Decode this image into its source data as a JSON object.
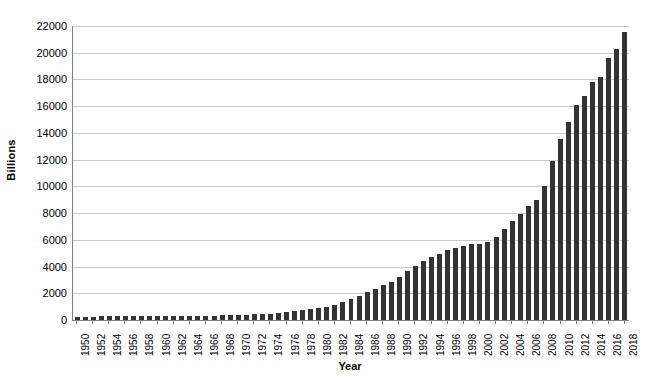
{
  "chart_data": {
    "type": "bar",
    "title": "",
    "subtitle": "",
    "xlabel": "Year",
    "ylabel": "Billions",
    "ylim": [
      0,
      22000
    ],
    "ytick_step": 2000,
    "yticks": [
      0,
      2000,
      4000,
      6000,
      8000,
      10000,
      12000,
      14000,
      16000,
      18000,
      20000,
      22000
    ],
    "ytick_labels": [
      "0",
      "2000",
      "4000",
      "6000",
      "8000",
      "10000",
      "12000",
      "14000",
      "16000",
      "18000",
      "20000",
      "22000"
    ],
    "xtick_label_step": 2,
    "xtick_labels": [
      "1950",
      "1952",
      "1954",
      "1956",
      "1958",
      "1960",
      "1962",
      "1964",
      "1966",
      "1968",
      "1970",
      "1972",
      "1974",
      "1976",
      "1978",
      "1980",
      "1982",
      "1984",
      "1986",
      "1988",
      "1990",
      "1992",
      "1994",
      "1996",
      "1998",
      "2000",
      "2002",
      "2004",
      "2006",
      "2008",
      "2010",
      "2012",
      "2014",
      "2016",
      "2018"
    ],
    "grid": true,
    "grid_axis": "y",
    "legend": false,
    "legend_position": "none",
    "bar_color": "#333333",
    "grid_color": "#c9c9c9",
    "axis_color": "#808080",
    "categories": [
      "1950",
      "1951",
      "1952",
      "1953",
      "1954",
      "1955",
      "1956",
      "1957",
      "1958",
      "1959",
      "1960",
      "1961",
      "1962",
      "1963",
      "1964",
      "1965",
      "1966",
      "1967",
      "1968",
      "1969",
      "1970",
      "1971",
      "1972",
      "1973",
      "1974",
      "1975",
      "1976",
      "1977",
      "1978",
      "1979",
      "1980",
      "1981",
      "1982",
      "1983",
      "1984",
      "1985",
      "1986",
      "1987",
      "1988",
      "1989",
      "1990",
      "1991",
      "1992",
      "1993",
      "1994",
      "1995",
      "1996",
      "1997",
      "1998",
      "1999",
      "2000",
      "2001",
      "2002",
      "2003",
      "2004",
      "2005",
      "2006",
      "2007",
      "2008",
      "2009",
      "2010",
      "2011",
      "2012",
      "2013",
      "2014",
      "2015",
      "2016",
      "2017",
      "2018"
    ],
    "values": [
      257,
      255,
      259,
      266,
      271,
      274,
      273,
      271,
      276,
      285,
      286,
      289,
      298,
      306,
      312,
      317,
      320,
      326,
      348,
      354,
      371,
      398,
      427,
      458,
      475,
      533,
      620,
      699,
      772,
      827,
      908,
      998,
      1142,
      1377,
      1572,
      1823,
      2125,
      2350,
      2602,
      2857,
      3233,
      3665,
      4065,
      4411,
      4693,
      4974,
      5225,
      5413,
      5526,
      5656,
      5674,
      5807,
      6228,
      6783,
      7379,
      7933,
      8507,
      9008,
      10025,
      11910,
      13562,
      14790,
      16066,
      16738,
      17824,
      18151,
      19573,
      20245,
      21516
    ],
    "series": [
      {
        "name": "Debt",
        "values": [
          257,
          255,
          259,
          266,
          271,
          274,
          273,
          271,
          276,
          285,
          286,
          289,
          298,
          306,
          312,
          317,
          320,
          326,
          348,
          354,
          371,
          398,
          427,
          458,
          475,
          533,
          620,
          699,
          772,
          827,
          908,
          998,
          1142,
          1377,
          1572,
          1823,
          2125,
          2350,
          2602,
          2857,
          3233,
          3665,
          4065,
          4411,
          4693,
          4974,
          5225,
          5413,
          5526,
          5656,
          5674,
          5807,
          6228,
          6783,
          7379,
          7933,
          8507,
          9008,
          10025,
          11910,
          13562,
          14790,
          16066,
          16738,
          17824,
          18151,
          19573,
          20245,
          21516
        ]
      }
    ]
  }
}
